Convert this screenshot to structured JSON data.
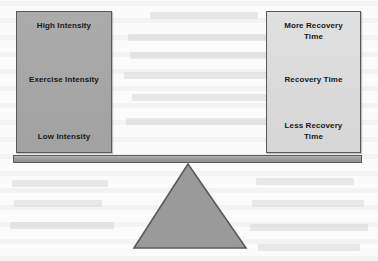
{
  "diagram": {
    "type": "balance-scale-seesaw"
  },
  "left_pan": {
    "name": "exercise-intensity-pan",
    "fill_color": "#a6a6a6",
    "border_color": "#58585a",
    "top_label": "High Intensity",
    "middle_label": "Exercise Intensity",
    "bottom_label": "Low Intensity"
  },
  "right_pan": {
    "name": "recovery-time-pan",
    "fill_color": "#dadada",
    "border_color": "#58585a",
    "top_label": "More Recovery\nTime",
    "middle_label": "Recovery Time",
    "bottom_label": "Less Recovery\nTime"
  },
  "beam": {
    "name": "balance-beam",
    "color": "#9d9d9d",
    "border_color": "#5b5b5d"
  },
  "fulcrum": {
    "name": "fulcrum-triangle",
    "color": "#9a9a9a",
    "border_color": "#5b5b5d"
  },
  "background": {
    "color": "#fbfbfb"
  }
}
